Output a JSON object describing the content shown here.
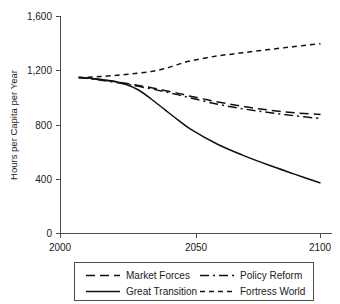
{
  "chart_data": {
    "type": "line",
    "title": "",
    "xlabel": "",
    "ylabel": "Hours per Capita per Year",
    "xlim": [
      2000,
      2100
    ],
    "ylim": [
      0,
      1600
    ],
    "xticks": [
      "2000",
      "2050",
      "2100"
    ],
    "xtick_values": [
      2000,
      2050,
      2100
    ],
    "yticks": [
      "0",
      "400",
      "800",
      "1,200",
      "1,600"
    ],
    "ytick_values": [
      0,
      400,
      800,
      1200,
      1600
    ],
    "grid": false,
    "legend_position": "bottom",
    "x": [
      2007,
      2010,
      2015,
      2020,
      2025,
      2030,
      2035,
      2040,
      2045,
      2050,
      2060,
      2070,
      2080,
      2090,
      2100
    ],
    "series": [
      {
        "name": "Market Forces",
        "dash": "long-dash",
        "values": [
          1150,
          1145,
          1135,
          1122,
          1108,
          1092,
          1075,
          1055,
          1035,
          1012,
          972,
          938,
          910,
          890,
          878
        ]
      },
      {
        "name": "Policy Reform",
        "dash": "dash-dot",
        "values": [
          1150,
          1144,
          1132,
          1118,
          1102,
          1085,
          1066,
          1046,
          1024,
          1000,
          955,
          920,
          893,
          868,
          848
        ]
      },
      {
        "name": "Great Transition",
        "dash": "solid",
        "values": [
          1150,
          1146,
          1138,
          1124,
          1100,
          1058,
          990,
          915,
          840,
          770,
          662,
          578,
          505,
          438,
          372
        ]
      },
      {
        "name": "Fortress World",
        "dash": "short-dash",
        "values": [
          1150,
          1152,
          1157,
          1164,
          1172,
          1182,
          1195,
          1215,
          1245,
          1272,
          1308,
          1332,
          1356,
          1378,
          1400
        ]
      }
    ]
  },
  "legend": {
    "entries": [
      {
        "label": "Market Forces",
        "dash": "long-dash"
      },
      {
        "label": "Policy Reform",
        "dash": "dash-dot"
      },
      {
        "label": "Great Transition",
        "dash": "solid"
      },
      {
        "label": "Fortress World",
        "dash": "short-dash"
      }
    ]
  },
  "colors": {
    "line": "#111111",
    "axis": "#4d4d4d",
    "text": "#1a1a1a",
    "background": "#ffffff"
  }
}
